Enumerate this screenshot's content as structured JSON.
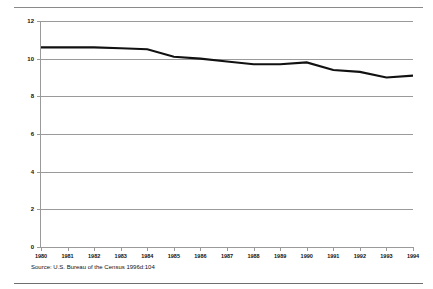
{
  "figure": {
    "source_note": "Source: U.S. Bureau of the Census 1996d:104",
    "axis_color": "#9a9a9a",
    "line_color": "#111111",
    "rule_color": "#8a8a8a",
    "background": "#ffffff"
  },
  "chart_data": {
    "type": "line",
    "title": "",
    "subtitle": "",
    "xlabel": "",
    "ylabel": "",
    "x": [
      1980,
      1981,
      1982,
      1983,
      1984,
      1985,
      1986,
      1987,
      1988,
      1989,
      1990,
      1991,
      1992,
      1993,
      1994
    ],
    "categories": [
      "1980",
      "1981",
      "1982",
      "1983",
      "1984",
      "1985",
      "1986",
      "1987",
      "1988",
      "1989",
      "1990",
      "1991",
      "1992",
      "1993",
      "1994"
    ],
    "values": [
      10.6,
      10.6,
      10.6,
      10.55,
      10.5,
      10.1,
      10.0,
      9.85,
      9.7,
      9.7,
      9.8,
      9.4,
      9.3,
      9.0,
      9.1
    ],
    "series": [
      {
        "name": "",
        "values": [
          10.6,
          10.6,
          10.6,
          10.55,
          10.5,
          10.1,
          10.0,
          9.85,
          9.7,
          9.7,
          9.8,
          9.4,
          9.3,
          9.0,
          9.1
        ]
      }
    ],
    "xlim": [
      1980,
      1994
    ],
    "ylim": [
      0,
      12
    ],
    "yticks": [
      0,
      2,
      4,
      6,
      8,
      10,
      12
    ],
    "ytick_labels": [
      "0",
      "2",
      "4",
      "6",
      "8",
      "10",
      "12"
    ],
    "xtick_labels": [
      "1980",
      "1981",
      "1982",
      "1983",
      "1984",
      "1985",
      "1986",
      "1987",
      "1988",
      "1989",
      "1990",
      "1991",
      "1992",
      "1993",
      "1994"
    ],
    "grid": true,
    "grid_axis": "y",
    "legend": null,
    "legend_position": "none",
    "annotations": []
  }
}
